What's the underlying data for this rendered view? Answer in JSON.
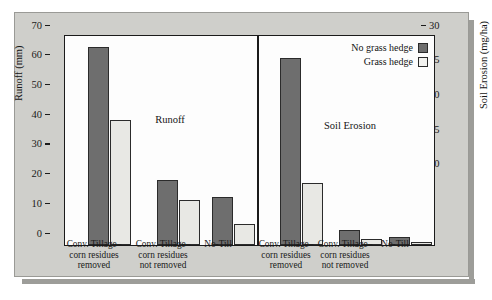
{
  "chart_data": {
    "type": "bar",
    "title": "",
    "panels": [
      {
        "name": "Runoff",
        "label": "Runoff",
        "ylabel": "Runoff (mm)",
        "ylim": [
          0,
          70
        ],
        "yticks": [
          0,
          10,
          20,
          30,
          40,
          50,
          60,
          70
        ],
        "axis_side": "left",
        "categories": [
          "Conv. Tillage–corn residues removed",
          "Conv. Tillage–corn residues not removed",
          "No-Till"
        ],
        "series": [
          {
            "name": "No grass hedge",
            "values": [
              66.5,
              22,
              16
            ]
          },
          {
            "name": "Grass hedge",
            "values": [
              42,
              15,
              7
            ]
          }
        ]
      },
      {
        "name": "Soil Erosion",
        "label": "Soil Erosion",
        "ylabel": "Soil Erosion (mg/ha)",
        "ylim": [
          0,
          30
        ],
        "yticks": [
          0,
          5,
          10,
          15,
          20,
          25,
          30
        ],
        "axis_side": "right",
        "categories": [
          "Conv. Tillage–corn residues removed",
          "Conv. Tillage–corn residues not removed",
          "No-Till"
        ],
        "series": [
          {
            "name": "No grass hedge",
            "values": [
              27,
              2.2,
              1.2
            ]
          },
          {
            "name": "Grass hedge",
            "values": [
              9,
              0.8,
              0.4
            ]
          }
        ]
      }
    ],
    "legend": {
      "position": "top-right",
      "entries": [
        {
          "label": "No grass hedge",
          "color": "#6e6e6e"
        },
        {
          "label": "Grass hedge",
          "color": "#f2f2ef"
        }
      ]
    },
    "grid": false,
    "xtick_lines": [
      [
        "Conv. Tillage–",
        "corn residues",
        "removed"
      ],
      [
        "Conv. Tillage–",
        "corn residues",
        "not removed"
      ],
      [
        "No-Till"
      ]
    ],
    "colors": {
      "background": "#cfcfcb",
      "plot_background": "#fdfdfd",
      "axis": "#1b1b1b",
      "no_grass_hedge": "#6e6e6e",
      "grass_hedge": "#e8e8e4"
    }
  }
}
